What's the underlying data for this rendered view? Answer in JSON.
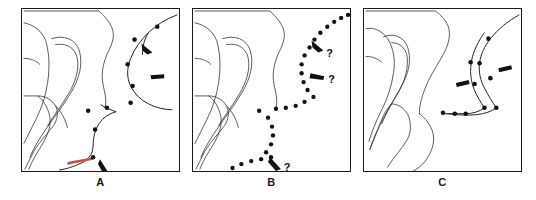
{
  "figure": {
    "type": "line-drawing-figure",
    "background_color": "#ffffff",
    "ink_color": "#1a1a1a",
    "accent_color": "#c0504d",
    "panel_count": 3
  },
  "panels": [
    {
      "id": "panel-a",
      "caption": "A",
      "description": "Outline map with smooth solid traced boundary, round point markers and teardrop arrowheads",
      "curve_style": "solid",
      "marker_style": "round-dots",
      "pointer_style": "teardrop-arrowhead",
      "pointer_count": 3,
      "marker_count": 9,
      "question_marks": 0,
      "has_accent_segment": true
    },
    {
      "id": "panel-b",
      "caption": "B",
      "description": "Same outline map with dotted traced boundary, arrowheads annotated with question marks",
      "curve_style": "dotted",
      "marker_style": "dense-dots",
      "pointer_style": "teardrop-arrowhead",
      "pointer_count": 3,
      "marker_count": 26,
      "question_marks": 3,
      "question_mark_label": "?",
      "has_accent_segment": false
    },
    {
      "id": "panel-c",
      "caption": "C",
      "description": "Same outline map with two nearly parallel solid traced boundaries, round dots and arrowheads",
      "curve_style": "solid-double",
      "marker_style": "round-dots",
      "pointer_style": "teardrop-arrowhead",
      "pointer_count": 2,
      "marker_count": 10,
      "question_marks": 0,
      "has_accent_segment": false
    }
  ]
}
